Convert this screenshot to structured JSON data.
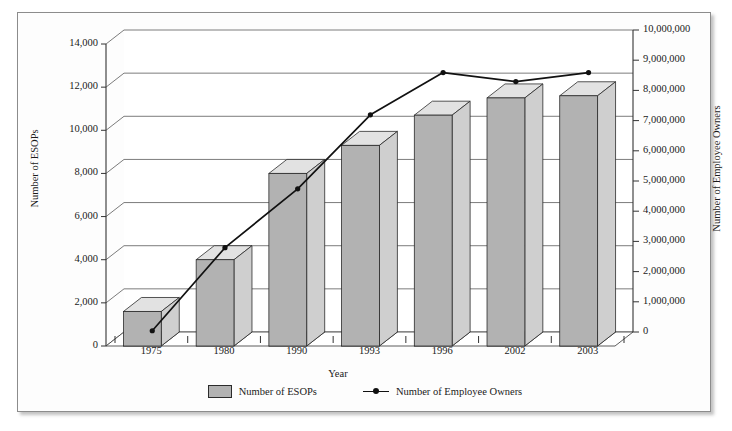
{
  "figure": {
    "top_ghost_text": "",
    "background_color": "#fdfdfd",
    "border_color": "#8c8c8c"
  },
  "legend": {
    "position": "bottom-center",
    "entries": [
      {
        "label": "Number of ESOPs",
        "marker": "bar-swatch",
        "color": "#b2b2b2"
      },
      {
        "label": "Number of Employee Owners",
        "marker": "line-with-point",
        "color": "#111111"
      }
    ]
  },
  "chart_data": {
    "type": "bar",
    "title": "",
    "subtitle": "",
    "xlabel": "Year",
    "ylabel": "Number of ESOPs",
    "y2label": "Number of Employee Owners",
    "grid": true,
    "legend_position": "bottom",
    "style": "3d-column-with-secondary-line",
    "categories": [
      "1975",
      "1980",
      "1990",
      "1993",
      "1996",
      "2002",
      "2003"
    ],
    "ylim": [
      0,
      14000
    ],
    "yticks": [
      "0",
      "2,000",
      "4,000",
      "6,000",
      "8,000",
      "10,000",
      "12,000",
      "14,000"
    ],
    "ytick_values": [
      0,
      2000,
      4000,
      6000,
      8000,
      10000,
      12000,
      14000
    ],
    "y2lim": [
      0,
      10000000
    ],
    "y2ticks": [
      "0",
      "1,000,000",
      "2,000,000",
      "3,000,000",
      "4,000,000",
      "5,000,000",
      "6,000,000",
      "7,000,000",
      "8,000,000",
      "9,000,000",
      "10,000,000"
    ],
    "y2tick_values": [
      0,
      1000000,
      2000000,
      3000000,
      4000000,
      5000000,
      6000000,
      7000000,
      8000000,
      9000000,
      10000000
    ],
    "series": [
      {
        "name": "Number of ESOPs",
        "axis": "left",
        "type": "bar",
        "color": "#b2b2b2",
        "values": [
          1600,
          4000,
          8000,
          9300,
          10700,
          11500,
          11600
        ]
      },
      {
        "name": "Number of Employee Owners",
        "axis": "right",
        "type": "line",
        "color": "#111111",
        "values": [
          250000,
          3000000,
          4950000,
          7400000,
          8800000,
          8500000,
          8800000
        ]
      }
    ]
  }
}
